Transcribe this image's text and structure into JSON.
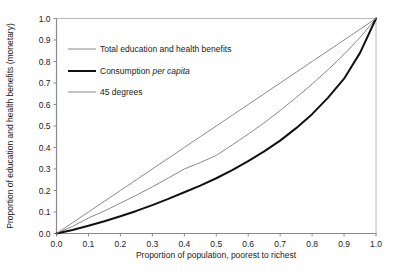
{
  "chart_data": {
    "type": "line",
    "title": "",
    "xlabel": "Proportion of population, poorest to richest",
    "ylabel": "Proportion of education and health benefits (monetary)",
    "xlim": [
      0.0,
      1.0
    ],
    "ylim": [
      0.0,
      1.0
    ],
    "grid": false,
    "legend_position": "upper-left-inside",
    "xticks": [
      "0.0",
      "0.1",
      "0.2",
      "0.3",
      "0.4",
      "0.5",
      "0.6",
      "0.7",
      "0.8",
      "0.9",
      "1.0"
    ],
    "yticks": [
      "0.0",
      "0.1",
      "0.2",
      "0.3",
      "0.4",
      "0.5",
      "0.6",
      "0.7",
      "0.8",
      "0.9",
      "1.0"
    ],
    "x": [
      0.0,
      0.05,
      0.1,
      0.15,
      0.2,
      0.25,
      0.3,
      0.35,
      0.4,
      0.45,
      0.5,
      0.55,
      0.6,
      0.65,
      0.7,
      0.75,
      0.8,
      0.85,
      0.9,
      0.95,
      1.0
    ],
    "series": [
      {
        "name": "Total education and health benefits",
        "color": "#8a8a8a",
        "width": 1.0,
        "values": [
          0.0,
          0.033,
          0.072,
          0.105,
          0.141,
          0.178,
          0.217,
          0.258,
          0.3,
          0.33,
          0.363,
          0.412,
          0.462,
          0.515,
          0.572,
          0.632,
          0.695,
          0.762,
          0.833,
          0.912,
          1.0
        ]
      },
      {
        "name": "Consumption per capita",
        "color": "#111111",
        "width": 2.0,
        "values": [
          0.0,
          0.016,
          0.036,
          0.057,
          0.08,
          0.105,
          0.132,
          0.161,
          0.192,
          0.223,
          0.257,
          0.295,
          0.337,
          0.382,
          0.432,
          0.49,
          0.555,
          0.632,
          0.72,
          0.84,
          1.0
        ]
      },
      {
        "name": "45 degrees",
        "color": "#8a8a8a",
        "width": 1.0,
        "values": [
          0.0,
          0.05,
          0.1,
          0.15,
          0.2,
          0.25,
          0.3,
          0.35,
          0.4,
          0.45,
          0.5,
          0.55,
          0.6,
          0.65,
          0.7,
          0.75,
          0.8,
          0.85,
          0.9,
          0.95,
          1.0
        ]
      }
    ],
    "legend": [
      {
        "label": "Total education and health benefits",
        "italic_part": "",
        "color": "#8a8a8a",
        "width": 1.0
      },
      {
        "label": "Consumption ",
        "italic_part": "per capita",
        "color": "#111111",
        "width": 2.0
      },
      {
        "label": "45 degrees",
        "italic_part": "",
        "color": "#8a8a8a",
        "width": 1.0
      }
    ],
    "axis_color": "#8a8a8a"
  }
}
